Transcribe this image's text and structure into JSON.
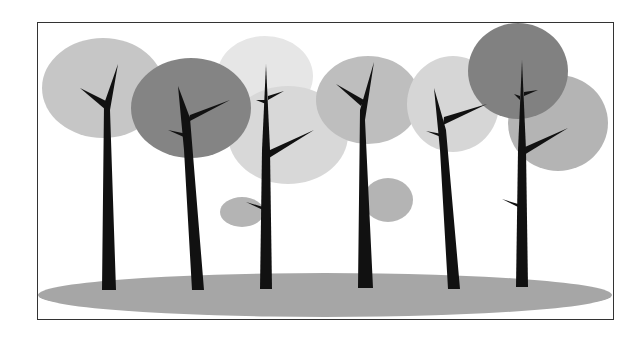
{
  "illustration": {
    "title": "Stylized forest of trees",
    "description": "Grayscale illustration of seven slender black trees with translucent circular canopies standing on a gray ground ellipse, inside a thin-bordered frame",
    "colors": {
      "background": "#ffffff",
      "border": "#333333",
      "trunk": "#111111",
      "ground": "#a9a9a9",
      "canopy_light": "#d6d6d6",
      "canopy_lighter": "#e4e4e4",
      "canopy_mid": "#b9b9b9",
      "canopy_dark": "#7a7a7a"
    },
    "tree_count": 7,
    "canopies": [
      {
        "name": "canopy-1",
        "cx": 103,
        "cy": 88,
        "rx": 61,
        "ry": 50,
        "tone": "mid"
      },
      {
        "name": "canopy-2",
        "cx": 191,
        "cy": 108,
        "rx": 60,
        "ry": 50,
        "tone": "dark"
      },
      {
        "name": "canopy-3",
        "cx": 265,
        "cy": 76,
        "rx": 48,
        "ry": 40,
        "tone": "lighter"
      },
      {
        "name": "canopy-4",
        "cx": 288,
        "cy": 135,
        "rx": 60,
        "ry": 49,
        "tone": "light"
      },
      {
        "name": "canopy-5",
        "cx": 368,
        "cy": 100,
        "rx": 52,
        "ry": 44,
        "tone": "mid"
      },
      {
        "name": "canopy-6",
        "cx": 453,
        "cy": 104,
        "rx": 46,
        "ry": 48,
        "tone": "light"
      },
      {
        "name": "canopy-7",
        "cx": 518,
        "cy": 71,
        "rx": 50,
        "ry": 48,
        "tone": "dark"
      },
      {
        "name": "canopy-8",
        "cx": 558,
        "cy": 123,
        "rx": 50,
        "ry": 48,
        "tone": "mid"
      },
      {
        "name": "canopy-small-1",
        "cx": 242,
        "cy": 212,
        "rx": 22,
        "ry": 15,
        "tone": "mid"
      },
      {
        "name": "canopy-small-2",
        "cx": 388,
        "cy": 200,
        "rx": 25,
        "ry": 22,
        "tone": "mid"
      }
    ],
    "ground": {
      "cx": 325,
      "cy": 295,
      "rx": 287,
      "ry": 22
    }
  }
}
